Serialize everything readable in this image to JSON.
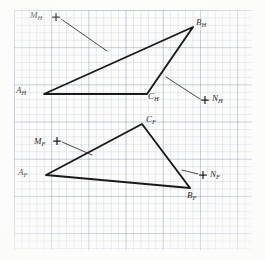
{
  "figure": {
    "paper": "graph paper",
    "grid": {
      "minor_px": 7.44,
      "major_every": 5,
      "color": "#8aa0bf"
    },
    "ink_color": "#1a1a1a"
  },
  "labels": [
    {
      "id": "MH",
      "base": "M",
      "sub": "H",
      "x": 30,
      "y": 11
    },
    {
      "id": "BH",
      "base": "B",
      "sub": "H",
      "x": 196,
      "y": 18
    },
    {
      "id": "AH",
      "base": "A",
      "sub": "H",
      "x": 16,
      "y": 86
    },
    {
      "id": "CH",
      "base": "C",
      "sub": "H",
      "x": 148,
      "y": 92
    },
    {
      "id": "NH",
      "base": "N",
      "sub": "H",
      "x": 212,
      "y": 94
    },
    {
      "id": "CF",
      "base": "C",
      "sub": "F",
      "x": 146,
      "y": 115
    },
    {
      "id": "MF",
      "base": "M",
      "sub": "F",
      "x": 34,
      "y": 137
    },
    {
      "id": "AF",
      "base": "A",
      "sub": "F",
      "x": 18,
      "y": 168
    },
    {
      "id": "NF",
      "base": "N",
      "sub": "F",
      "x": 210,
      "y": 170
    },
    {
      "id": "BF",
      "base": "B",
      "sub": "F",
      "x": 187,
      "y": 191
    }
  ],
  "triangles": [
    {
      "name": "horizontal-projection-triangle",
      "view": "H",
      "vertices": [
        {
          "id": "AH",
          "x": 44,
          "y": 94
        },
        {
          "id": "BH",
          "x": 193,
          "y": 27
        },
        {
          "id": "CH",
          "x": 147,
          "y": 94
        }
      ]
    },
    {
      "name": "frontal-projection-triangle",
      "view": "F",
      "vertices": [
        {
          "id": "AF",
          "x": 46,
          "y": 175
        },
        {
          "id": "CF",
          "x": 142,
          "y": 124
        },
        {
          "id": "BF",
          "x": 190,
          "y": 188
        }
      ]
    }
  ],
  "points": [
    {
      "id": "MH",
      "x": 56,
      "y": 17,
      "marker": "plus"
    },
    {
      "id": "NH",
      "x": 205,
      "y": 100,
      "marker": "plus"
    },
    {
      "id": "MF",
      "x": 57,
      "y": 141,
      "marker": "plus"
    },
    {
      "id": "NF",
      "x": 203,
      "y": 175,
      "marker": "plus"
    }
  ],
  "leaders": [
    {
      "name": "leader-mh",
      "from": {
        "x": 61,
        "y": 19
      },
      "to": {
        "x": 107,
        "y": 51
      }
    },
    {
      "name": "leader-nh",
      "from": {
        "x": 200,
        "y": 99
      },
      "to": {
        "x": 166,
        "y": 77
      }
    },
    {
      "name": "leader-mf",
      "from": {
        "x": 62,
        "y": 142
      },
      "to": {
        "x": 92,
        "y": 155
      }
    },
    {
      "name": "leader-nf",
      "from": {
        "x": 198,
        "y": 174
      },
      "to": {
        "x": 182,
        "y": 170
      }
    }
  ]
}
